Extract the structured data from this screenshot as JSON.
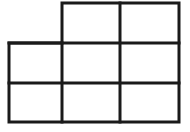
{
  "figure": {
    "kind": "polyomino-grid-diagram",
    "background_color": "#ffffff",
    "line_color": "#1a1a1a",
    "line_width": 3,
    "canvas": {
      "width": 190,
      "height": 132
    },
    "geometry": {
      "vertical_gridlines_x": [
        9,
        62,
        120,
        179
      ],
      "horizontal_gridlines_y": [
        3,
        43,
        83,
        122
      ],
      "column_edges_x": [
        9,
        62,
        120,
        179
      ],
      "row_edges_y": [
        3,
        43,
        83,
        122
      ],
      "cell_width": 58,
      "cell_height": 40
    },
    "counts": {
      "cells_total": 5,
      "rows": 3,
      "columns": 3,
      "top_row_cells": 2,
      "middle_row_cells": 3,
      "bottom_row_cells": 3
    },
    "cells": [
      {
        "id": "r1c2",
        "row": 1,
        "col": 2,
        "x": 62,
        "y": 3,
        "w": 58,
        "h": 40,
        "label": ""
      },
      {
        "id": "r1c3",
        "row": 1,
        "col": 3,
        "x": 120,
        "y": 3,
        "w": 59,
        "h": 40,
        "label": ""
      },
      {
        "id": "r2c1",
        "row": 2,
        "col": 1,
        "x": 9,
        "y": 43,
        "w": 53,
        "h": 40,
        "label": ""
      },
      {
        "id": "r2c2",
        "row": 2,
        "col": 2,
        "x": 62,
        "y": 43,
        "w": 58,
        "h": 40,
        "label": ""
      },
      {
        "id": "r2c3",
        "row": 2,
        "col": 3,
        "x": 120,
        "y": 43,
        "w": 59,
        "h": 40,
        "label": ""
      },
      {
        "id": "r3c1",
        "row": 3,
        "col": 1,
        "x": 9,
        "y": 83,
        "w": 53,
        "h": 39,
        "label": ""
      },
      {
        "id": "r3c2",
        "row": 3,
        "col": 2,
        "x": 62,
        "y": 83,
        "w": 58,
        "h": 39,
        "label": ""
      },
      {
        "id": "r3c3",
        "row": 3,
        "col": 3,
        "x": 120,
        "y": 83,
        "w": 59,
        "h": 39,
        "label": ""
      }
    ],
    "outline_path": "M 62 3 L 179 3 L 179 122 L 9 122 L 9 43 L 62 43 Z",
    "inner_segments": [
      {
        "name": "horizontal-divider-upper",
        "x1": 9,
        "y1": 43,
        "x2": 179,
        "y2": 43
      },
      {
        "name": "horizontal-divider-lower",
        "x1": 9,
        "y1": 83,
        "x2": 179,
        "y2": 83
      },
      {
        "name": "vertical-divider-left",
        "x1": 62,
        "y1": 43,
        "x2": 62,
        "y2": 122
      },
      {
        "name": "vertical-divider-right",
        "x1": 120,
        "y1": 3,
        "x2": 120,
        "y2": 122
      }
    ]
  }
}
